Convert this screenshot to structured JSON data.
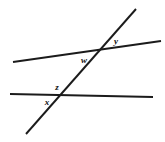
{
  "figure": {
    "background_color": "#ffffff",
    "stroke_color": "#1b1b1b",
    "label_color": "#101010",
    "width": 165,
    "height": 142
  },
  "lines": [
    {
      "name": "upper-slanted-line",
      "x1": 13,
      "y1": 62,
      "x2": 161,
      "y2": 41,
      "thickness": 1.9
    },
    {
      "name": "lower-horizontal-line",
      "x1": 10,
      "y1": 94,
      "x2": 153,
      "y2": 97,
      "thickness": 1.9
    },
    {
      "name": "diagonal-transversal-line",
      "x1": 136,
      "y1": 9,
      "x2": 26,
      "y2": 134,
      "thickness": 1.9
    }
  ],
  "intersections": [
    {
      "name": "upper-intersection",
      "x": 98,
      "y": 50
    },
    {
      "name": "lower-intersection",
      "x": 62,
      "y": 96
    }
  ],
  "labels": [
    {
      "id": "w",
      "text": "w",
      "x": 84,
      "y": 60,
      "size": 9
    },
    {
      "id": "y",
      "text": "y",
      "x": 116,
      "y": 41,
      "size": 9
    },
    {
      "id": "z",
      "text": "z",
      "x": 57,
      "y": 87,
      "size": 9
    },
    {
      "id": "x",
      "text": "x",
      "x": 47,
      "y": 102,
      "size": 9
    }
  ]
}
